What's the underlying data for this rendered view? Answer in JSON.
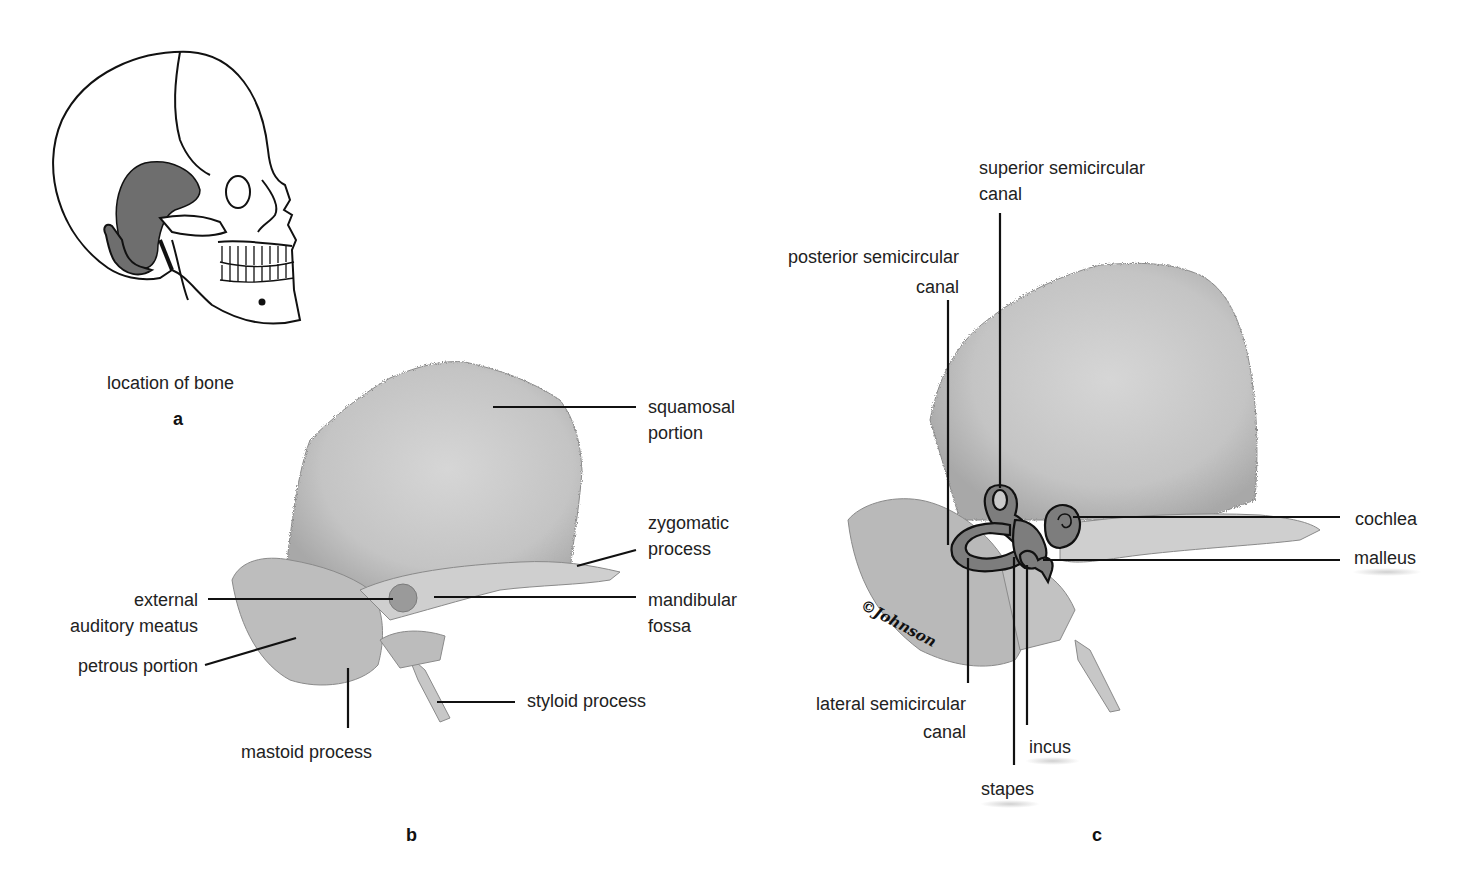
{
  "figure": {
    "colors": {
      "bone_fill": "#c9c9c9",
      "bone_shade": "#a9a9a9",
      "highlight_region": "#6e6e6e",
      "leader_line": "#111111",
      "inner_ear_fill": "#7d7d7d"
    }
  },
  "panel_a": {
    "letter": "a",
    "caption": "location of bone"
  },
  "panel_b": {
    "letter": "b",
    "labels": {
      "squamosal": [
        "squamosal",
        "portion"
      ],
      "zygomatic": [
        "zygomatic",
        "process"
      ],
      "mandibular": [
        "mandibular",
        "fossa"
      ],
      "external_auditory": [
        "external",
        "auditory meatus"
      ],
      "petrous": "petrous portion",
      "mastoid": "mastoid process",
      "styloid": "styloid process"
    }
  },
  "panel_c": {
    "letter": "c",
    "signature": "©Johnson",
    "labels": {
      "superior": [
        "superior semicircular",
        "canal"
      ],
      "posterior": [
        "posterior semicircular",
        "canal"
      ],
      "lateral": [
        "lateral semicircular",
        "canal"
      ],
      "cochlea": "cochlea",
      "malleus": "malleus",
      "incus": "incus",
      "stapes": "stapes"
    }
  }
}
